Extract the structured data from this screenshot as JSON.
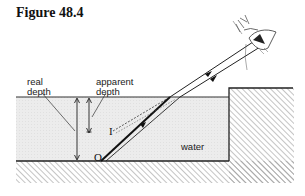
{
  "figure": {
    "title": "Figure 48.4"
  },
  "labels": {
    "real_depth_line1": "real",
    "real_depth_line2": "depth",
    "apparent_depth_line1": "apparent",
    "apparent_depth_line2": "depth",
    "water": "water",
    "object_point": "O",
    "image_point": "I"
  },
  "colors": {
    "ink": "#222222",
    "water_fill": "#ebebeb",
    "hatch": "#8a8a8a"
  }
}
